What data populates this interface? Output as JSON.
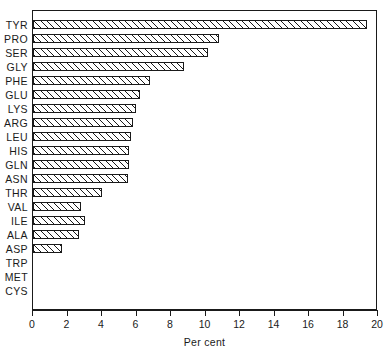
{
  "chart_data": {
    "type": "bar",
    "orientation": "horizontal",
    "title": "",
    "subtitle": "",
    "xlabel": "Per cent",
    "ylabel": "",
    "xlim": [
      0,
      20
    ],
    "ylim": null,
    "grid": false,
    "legend": null,
    "xticks": [
      0,
      2,
      4,
      6,
      8,
      10,
      12,
      14,
      16,
      18,
      20
    ],
    "xticklabels": [
      "0",
      "2",
      "4",
      "6",
      "8",
      "10",
      "12",
      "14",
      "16",
      "18",
      "20"
    ],
    "bar_style": {
      "fill": "hatched-diagonal",
      "edge_color": "#1a1a1a",
      "face_color": "#ffffff"
    },
    "categories": [
      "TYR",
      "PRO",
      "SER",
      "GLY",
      "PHE",
      "GLU",
      "LYS",
      "ARG",
      "LEU",
      "HIS",
      "GLN",
      "ASN",
      "THR",
      "VAL",
      "ILE",
      "ALA",
      "ASP",
      "TRP",
      "MET",
      "CYS"
    ],
    "values": [
      19.4,
      10.8,
      10.2,
      8.8,
      6.8,
      6.2,
      6.0,
      5.8,
      5.7,
      5.6,
      5.6,
      5.5,
      4.0,
      2.8,
      3.0,
      2.7,
      1.7,
      0,
      0,
      0
    ],
    "bars": [
      {
        "label": "TYR",
        "value": 19.4
      },
      {
        "label": "PRO",
        "value": 10.8
      },
      {
        "label": "SER",
        "value": 10.2
      },
      {
        "label": "GLY",
        "value": 8.8
      },
      {
        "label": "PHE",
        "value": 6.8
      },
      {
        "label": "GLU",
        "value": 6.2
      },
      {
        "label": "LYS",
        "value": 6.0
      },
      {
        "label": "ARG",
        "value": 5.8
      },
      {
        "label": "LEU",
        "value": 5.7
      },
      {
        "label": "HIS",
        "value": 5.6
      },
      {
        "label": "GLN",
        "value": 5.6
      },
      {
        "label": "ASN",
        "value": 5.5
      },
      {
        "label": "THR",
        "value": 4.0
      },
      {
        "label": "VAL",
        "value": 2.8
      },
      {
        "label": "ILE",
        "value": 3.0
      },
      {
        "label": "ALA",
        "value": 2.7
      },
      {
        "label": "ASP",
        "value": 1.7
      },
      {
        "label": "TRP",
        "value": 0
      },
      {
        "label": "MET",
        "value": 0
      },
      {
        "label": "CYS",
        "value": 0
      }
    ]
  }
}
